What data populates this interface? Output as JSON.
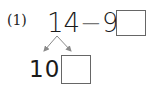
{
  "problem": {
    "label": "(1)",
    "equation": {
      "minuend": "14",
      "operator": "−",
      "subtrahend": "9",
      "equals": "="
    },
    "answer_value": ""
  },
  "decomposition": {
    "known_part": "10",
    "unknown_part_value": ""
  },
  "colors": {
    "text": "#1a1a1a",
    "box_border": "#666666",
    "arrow": "#8a8a8a"
  }
}
